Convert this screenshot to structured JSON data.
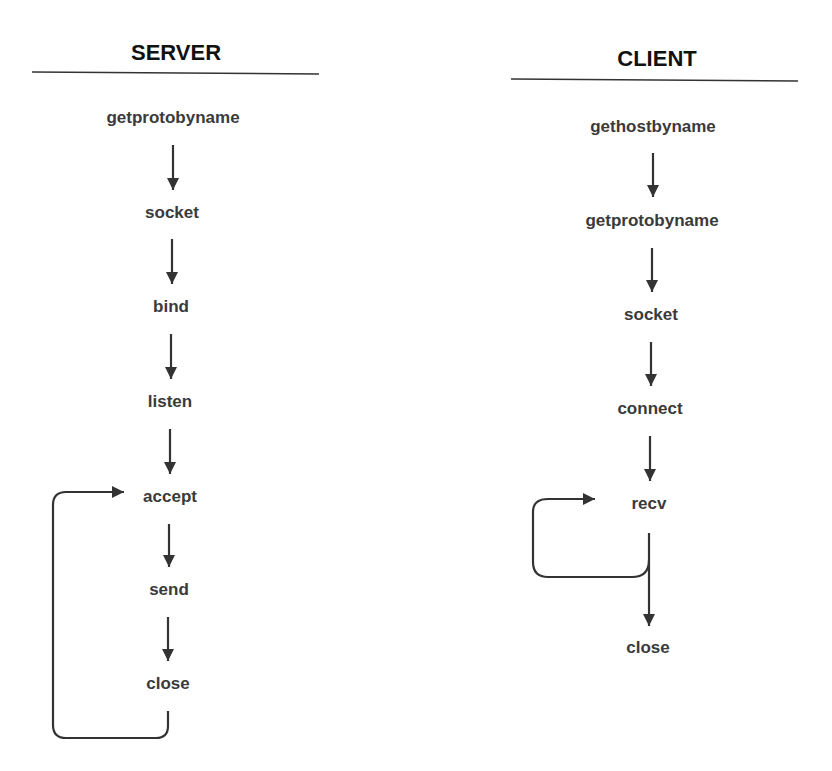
{
  "server": {
    "title": "SERVER",
    "steps": [
      "getprotobyname",
      "socket",
      "bind",
      "listen",
      "accept",
      "send",
      "close"
    ]
  },
  "client": {
    "title": "CLIENT",
    "steps": [
      "gethostbyname",
      "getprotobyname",
      "socket",
      "connect",
      "recv",
      "close"
    ]
  },
  "colors": {
    "text": "#3a3a3a",
    "line": "#333333"
  }
}
